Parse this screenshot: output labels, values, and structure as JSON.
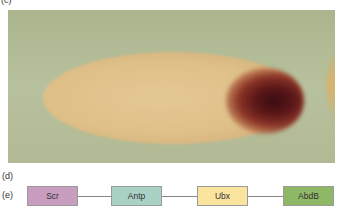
{
  "panels": {
    "c": {
      "label": "(c)"
    },
    "d": {
      "label": "(d)"
    },
    "e": {
      "label": "(e)"
    }
  },
  "photo": {
    "description": "Embryo with dark posterior stain",
    "background_color": "#b5be98",
    "embryo_color": "#e0c38c",
    "stain_color": "#3a0d12"
  },
  "gene_map": {
    "genes": [
      {
        "name": "Scr",
        "color": "#c89dc0",
        "left": 27
      },
      {
        "name": "Antp",
        "color": "#a9d2c4",
        "left": 111
      },
      {
        "name": "Ubx",
        "color": "#fbe3a0",
        "left": 197
      },
      {
        "name": "AbdB",
        "color": "#8fb866",
        "left": 283
      }
    ]
  }
}
